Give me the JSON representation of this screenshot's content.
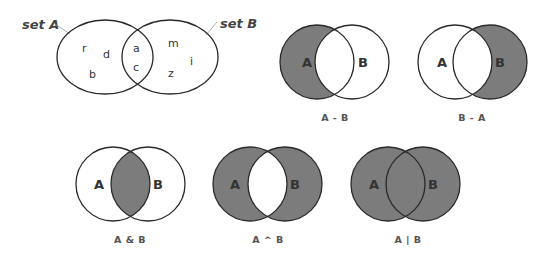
{
  "colors": {
    "shade": "#7c7c7c",
    "outline": "#2a2a2a",
    "background": "#ffffff"
  },
  "example": {
    "set_a_title": "set A",
    "set_b_title": "set B",
    "only_a": [
      "r",
      "d",
      "b"
    ],
    "both": [
      "a",
      "c"
    ],
    "only_b": [
      "m",
      "z",
      "i"
    ]
  },
  "diagrams": [
    {
      "id": "difference-a-b",
      "left_label": "A",
      "right_label": "B",
      "caption": "A - B",
      "shaded": "A only"
    },
    {
      "id": "difference-b-a",
      "left_label": "A",
      "right_label": "B",
      "caption": "B - A",
      "shaded": "B only"
    },
    {
      "id": "intersection",
      "left_label": "A",
      "right_label": "B",
      "caption": "A & B",
      "shaded": "intersection"
    },
    {
      "id": "symmetric-difference",
      "left_label": "A",
      "right_label": "B",
      "caption": "A ^ B",
      "shaded": "A or B but not both"
    },
    {
      "id": "union",
      "left_label": "A",
      "right_label": "B",
      "caption": "A | B",
      "shaded": "A or B"
    }
  ]
}
